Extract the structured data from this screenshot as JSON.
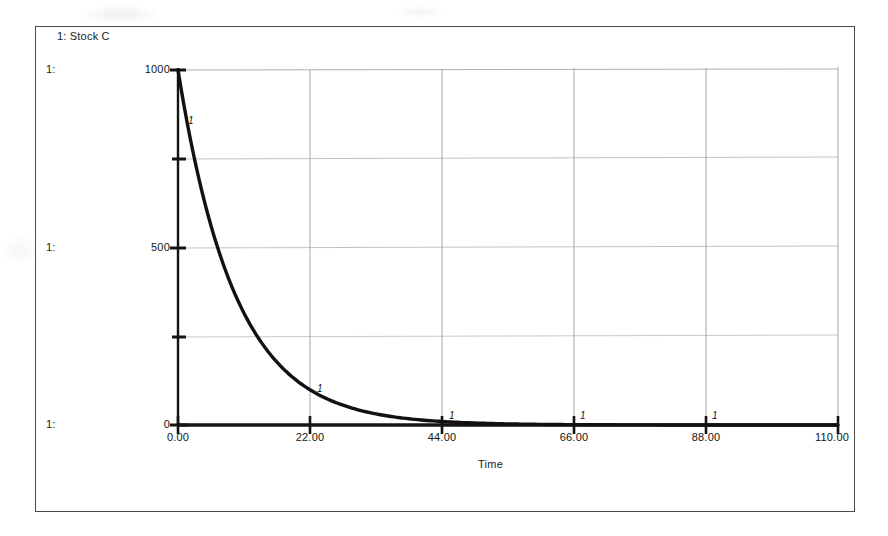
{
  "window": {
    "background_color": "#ffffff",
    "frame_color": "#4a4a4a"
  },
  "legend": {
    "entries": [
      {
        "index_label": "1:",
        "name": "Stock C",
        "text": "1: Stock C"
      }
    ],
    "text": "1: Stock C"
  },
  "axis_markers": {
    "top": "1:",
    "middle": "1:",
    "bottom": "1:"
  },
  "chart_data": {
    "type": "line",
    "title": "1: Stock C",
    "xlabel": "Time",
    "ylabel": "",
    "xlim": [
      0,
      110
    ],
    "ylim": [
      0,
      1000
    ],
    "grid": true,
    "grid_color": "#b9b9b9",
    "legend_position": "top-left",
    "xticks": [
      0,
      22,
      44,
      66,
      88,
      110
    ],
    "xtick_labels": [
      "0.00",
      "22.00",
      "44.00",
      "66.00",
      "88.00",
      "110.00"
    ],
    "yticks": [
      0,
      250,
      500,
      750,
      1000
    ],
    "ytick_labels": [
      "0",
      "",
      "500",
      "",
      "1000"
    ],
    "series": [
      {
        "name": "Stock C",
        "marker_label": "1",
        "color": "#111111",
        "line_width": 3,
        "description": "exponential decay from 1000 toward 0",
        "model": "1000 * exp(-0.105 * t)",
        "marker_points": [
          {
            "x": 0,
            "y": 1000
          },
          {
            "x": 22,
            "y": 99
          },
          {
            "x": 44,
            "y": 10
          },
          {
            "x": 66,
            "y": 1
          },
          {
            "x": 88,
            "y": 0
          },
          {
            "x": 110,
            "y": 0
          }
        ],
        "x": [
          0,
          2,
          4,
          6,
          8,
          10,
          12,
          14,
          16,
          18,
          20,
          22,
          26,
          30,
          34,
          38,
          44,
          50,
          56,
          62,
          66,
          72,
          80,
          88,
          96,
          104,
          110
        ],
        "values": [
          1000,
          811,
          657,
          533,
          432,
          350,
          284,
          230,
          186,
          151,
          122,
          99,
          65,
          43,
          28,
          18,
          10,
          5.3,
          2.8,
          1.5,
          1.0,
          0.5,
          0.2,
          0.1,
          0.04,
          0.02,
          0.01
        ]
      }
    ]
  }
}
